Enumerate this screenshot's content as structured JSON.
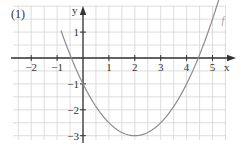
{
  "figure_label": "(1)",
  "colors": {
    "grid": "#d4d4d4",
    "axis": "#333333",
    "curve": "#8c8c8c",
    "text": "#333333",
    "curve_label": "#9a9a9a"
  },
  "chart_data": {
    "type": "line",
    "title": "(1)",
    "xlabel": "x",
    "ylabel": "y",
    "xlim": [
      -2.7,
      5.8
    ],
    "ylim": [
      -3.1,
      2.0
    ],
    "grid": true,
    "grid_step": 0.5,
    "x_ticks": [
      -2,
      -1,
      1,
      2,
      3,
      4,
      5
    ],
    "x_tick_labels": [
      "−2",
      "−1",
      "1",
      "2",
      "3",
      "4",
      "5"
    ],
    "y_ticks": [
      1,
      -1,
      -2,
      -3
    ],
    "y_tick_labels": [
      "1",
      "−1",
      "−2",
      "−3"
    ],
    "legend": [],
    "annotations": [
      {
        "text": "f",
        "x": 5.35,
        "y": 1.3
      }
    ],
    "series": [
      {
        "name": "f",
        "function": "f(x) = 0.5(x − 2)² − 3",
        "x": [
          -0.85,
          -0.5,
          -0.449,
          0,
          0.5,
          1,
          1.5,
          2,
          2.5,
          3,
          3.5,
          4,
          4.449,
          4.5,
          5,
          5.3
        ],
        "y": [
          1.06,
          0.125,
          0,
          -1,
          -1.875,
          -2.5,
          -2.875,
          -3,
          -2.875,
          -2.5,
          -1.875,
          -1,
          0,
          0.125,
          1.5,
          2.445
        ]
      }
    ],
    "key_points": {
      "vertex": [
        2,
        -3
      ],
      "y_intercept": [
        0,
        -1
      ],
      "x_intercepts": [
        -0.449,
        4.449
      ]
    }
  }
}
